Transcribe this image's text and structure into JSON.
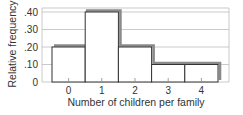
{
  "chart_data": {
    "type": "bar",
    "subtype": "histogram",
    "title": "",
    "xlabel": "Number of children per family",
    "ylabel": "Relative frequency",
    "categories": [
      "0",
      "1",
      "2",
      "3",
      "4"
    ],
    "values": [
      0.2,
      0.4,
      0.2,
      0.1,
      0.1
    ],
    "y_tick_labels": [
      "0",
      ".10",
      ".20",
      ".30",
      ".40"
    ],
    "y_ticks": [
      0,
      0.1,
      0.2,
      0.3,
      0.4
    ],
    "ylim": [
      0,
      0.4
    ],
    "grid": true,
    "legend": null,
    "bar_style": {
      "fill": "#ffffff",
      "edge": "#333333",
      "shadow": "#8a8a8a",
      "gridline": "#bdbdbd"
    }
  }
}
